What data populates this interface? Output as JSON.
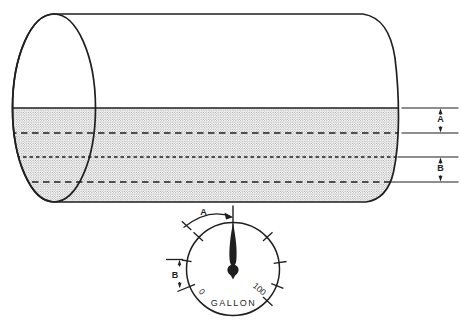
{
  "diagram": {
    "tank": {
      "dim_a_label": "A",
      "dim_b_label": "B"
    },
    "gauge": {
      "dim_a_label": "A",
      "dim_b_label": "B",
      "min_label": "0",
      "max_label": "100",
      "unit_label": "GALLON"
    },
    "colors": {
      "ink": "#1f1f1f",
      "stipple_dot": "#777777",
      "background": "#ffffff"
    }
  }
}
